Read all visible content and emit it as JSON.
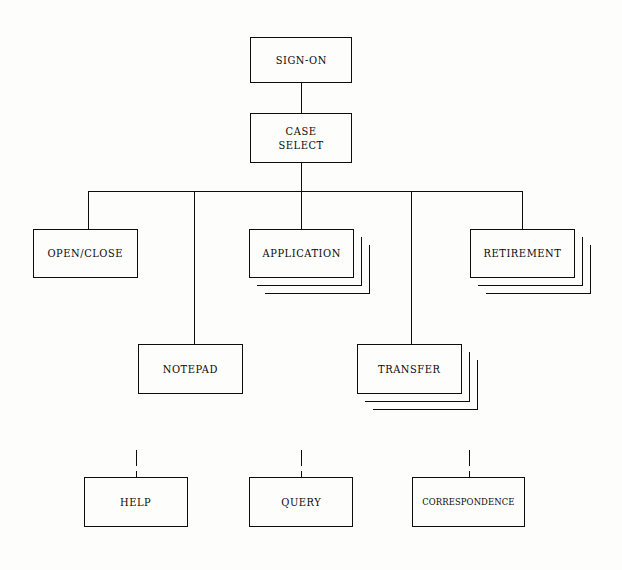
{
  "diagram": {
    "background_color": "#fdfdfb",
    "line_color": "#0d0d0d",
    "nodes": {
      "sign_on": {
        "label": "SIGN-ON",
        "x": 250,
        "y": 37,
        "w": 102,
        "h": 46,
        "stacked": false
      },
      "case_select": {
        "label": "CASE\nSELECT",
        "x": 250,
        "y": 113,
        "w": 102,
        "h": 50,
        "stacked": false
      },
      "open_close": {
        "label": "OPEN/CLOSE",
        "x": 33,
        "y": 229,
        "w": 105,
        "h": 49,
        "stacked": false
      },
      "application": {
        "label": "APPLICATION",
        "x": 249,
        "y": 229,
        "w": 105,
        "h": 49,
        "stacked": true
      },
      "retirement": {
        "label": "RETIREMENT",
        "x": 470,
        "y": 229,
        "w": 105,
        "h": 49,
        "stacked": true
      },
      "notepad": {
        "label": "NOTEPAD",
        "x": 138,
        "y": 344,
        "w": 105,
        "h": 50,
        "stacked": false
      },
      "transfer": {
        "label": "TRANSFER",
        "x": 357,
        "y": 344,
        "w": 105,
        "h": 50,
        "stacked": true
      },
      "help": {
        "label": "HELP",
        "x": 84,
        "y": 477,
        "w": 104,
        "h": 50,
        "stacked": false
      },
      "query": {
        "label": "QUERY",
        "x": 249,
        "y": 477,
        "w": 104,
        "h": 50,
        "stacked": false
      },
      "correspondence": {
        "label": "CORRESPONDENCE",
        "x": 412,
        "y": 477,
        "w": 113,
        "h": 50,
        "stacked": false
      }
    },
    "connections": [
      {
        "from": "sign_on",
        "to": "case_select",
        "style": "solid"
      },
      {
        "from": "case_select",
        "to": "bus",
        "style": "solid"
      },
      {
        "from": "bus",
        "to": "open_close",
        "style": "solid"
      },
      {
        "from": "bus",
        "to": "notepad",
        "style": "solid"
      },
      {
        "from": "bus",
        "to": "application",
        "style": "solid"
      },
      {
        "from": "bus",
        "to": "transfer",
        "style": "solid"
      },
      {
        "from": "bus",
        "to": "retirement",
        "style": "solid"
      },
      {
        "from": "detached",
        "to": "help",
        "style": "dashed"
      },
      {
        "from": "detached",
        "to": "query",
        "style": "dashed"
      },
      {
        "from": "detached",
        "to": "correspondence",
        "style": "dashed"
      }
    ],
    "bus": {
      "y": 191,
      "x_start": 88,
      "x_end": 522
    },
    "stack_offsets": [
      8,
      16
    ]
  }
}
